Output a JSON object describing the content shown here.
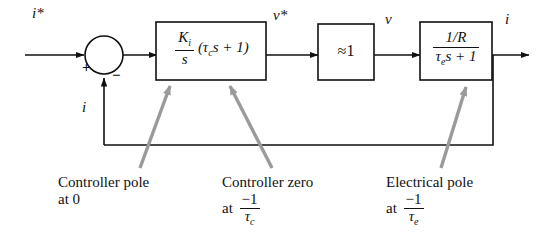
{
  "figure": {
    "type": "control-block-diagram",
    "background_color": "#ffffff",
    "line_color": "#111111",
    "pointer_color": "#9a9a9a"
  },
  "signals": {
    "reference_input": "i*",
    "feedback": "i",
    "controller_output": "v*",
    "plant_input": "v",
    "output": "i"
  },
  "summing_junction": {
    "name": "summing-junction",
    "plus_sign": "+",
    "minus_sign": "−"
  },
  "blocks": [
    {
      "id": "controller",
      "numerator": "K",
      "numerator_sub": "i",
      "denominator": "s",
      "factor": "(τ",
      "factor_sub": "c",
      "factor_rest": "s + 1)"
    },
    {
      "id": "converter",
      "label": "≈1"
    },
    {
      "id": "electrical-plant",
      "numerator": "1/R",
      "denominator_tau": "τ",
      "denominator_sub": "e",
      "denominator_rest": "s + 1"
    }
  ],
  "annotations": [
    {
      "id": "controller-pole",
      "line1": "Controller pole",
      "line2_prefix": "at 0",
      "has_fraction": false
    },
    {
      "id": "controller-zero",
      "line1": "Controller zero",
      "line2_prefix": "at",
      "has_fraction": true,
      "frac_num": "−1",
      "frac_den_tau": "τ",
      "frac_den_sub": "c"
    },
    {
      "id": "electrical-pole",
      "line1": "Electrical pole",
      "line2_prefix": "at",
      "has_fraction": true,
      "frac_num": "−1",
      "frac_den_tau": "τ",
      "frac_den_sub": "e"
    }
  ]
}
